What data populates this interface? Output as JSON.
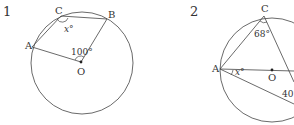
{
  "figures": [
    {
      "number": "1",
      "points": {
        "A": "A",
        "B": "B",
        "C": "C",
        "O": "O"
      },
      "angles": {
        "x": "x°",
        "center": "100°"
      }
    },
    {
      "number": "2",
      "points": {
        "A": "A",
        "C": "C",
        "O": "O"
      },
      "angles": {
        "C": "68°",
        "A": "x°",
        "other": "40°"
      }
    }
  ],
  "colors": {
    "stroke": "#333333",
    "background": "#ffffff"
  }
}
